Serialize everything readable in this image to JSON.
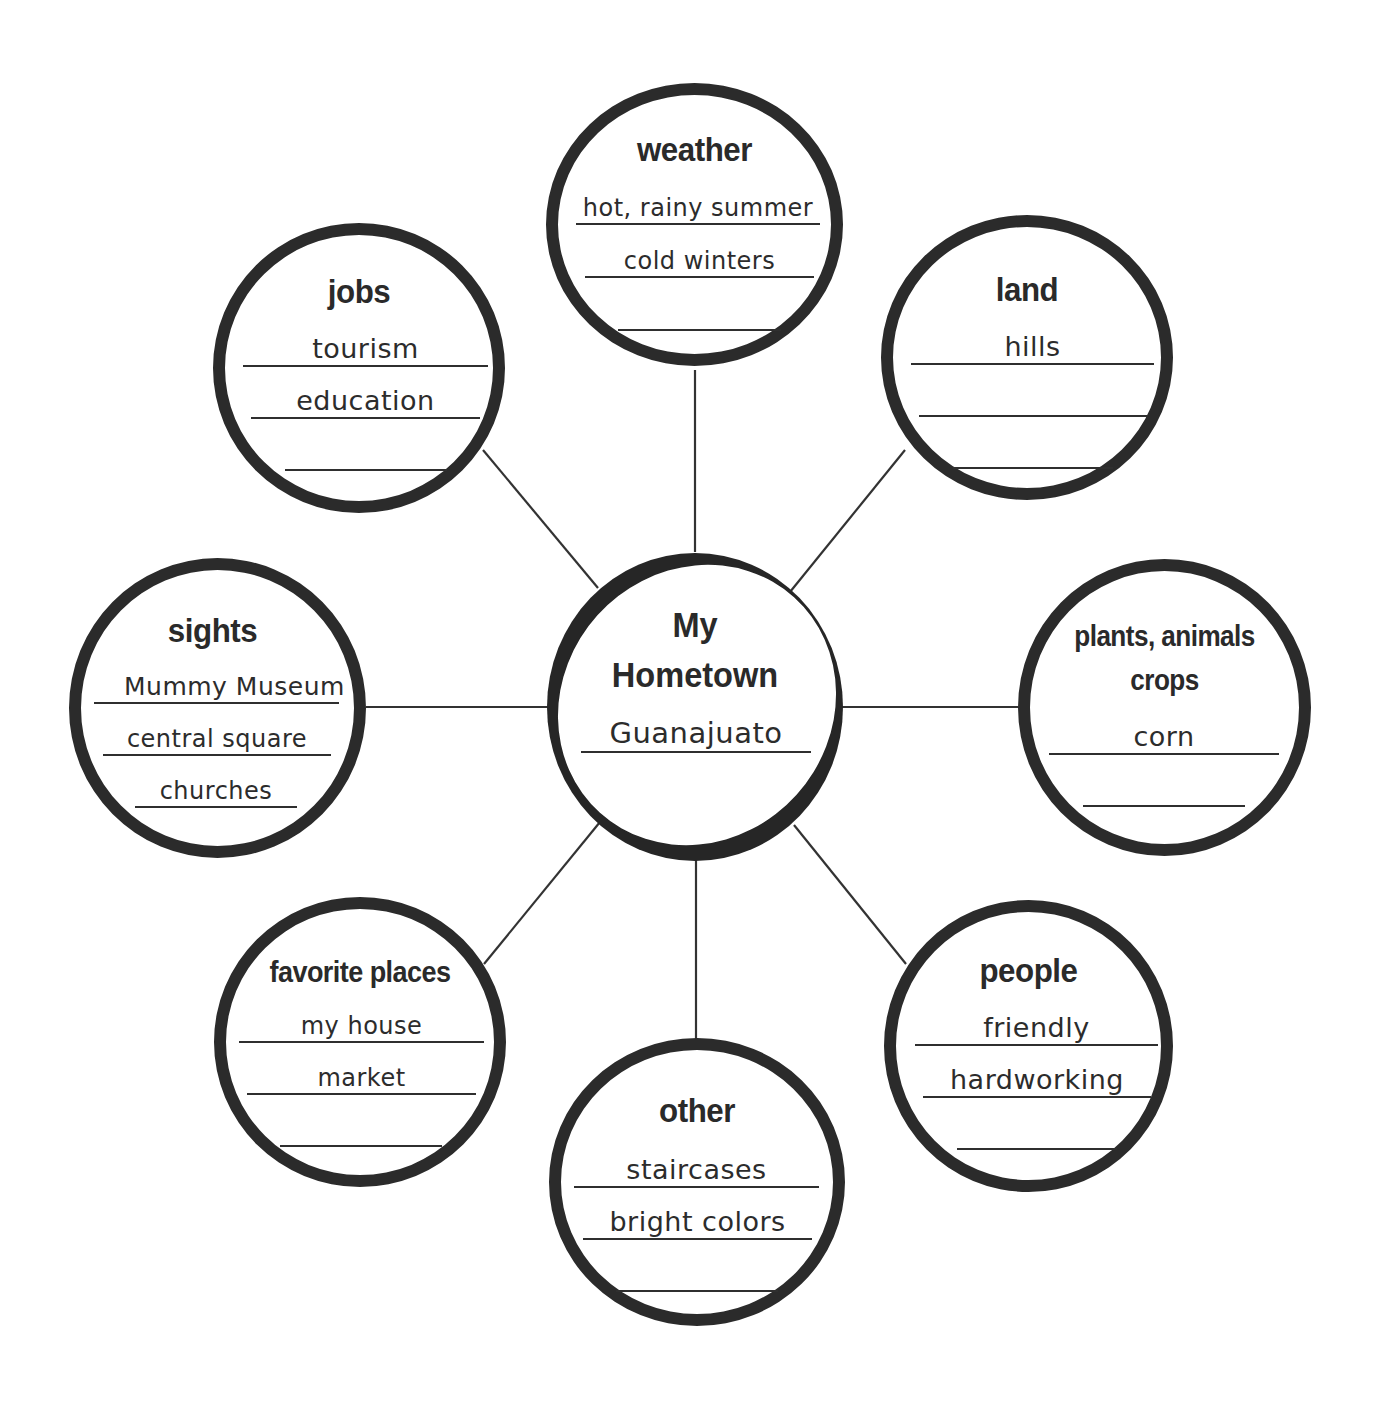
{
  "diagram": {
    "type": "bubble-map",
    "colors": {
      "stroke": "#2b2b2b",
      "background": "#ffffff",
      "text": "#2a2a2a"
    },
    "center": {
      "title_line1": "My",
      "title_line2": "Hometown",
      "answer": "Guanajuato"
    },
    "bubbles": {
      "weather": {
        "title": "weather",
        "lines": [
          "hot, rainy summer",
          "cold winters",
          ""
        ]
      },
      "jobs": {
        "title": "jobs",
        "lines": [
          "tourism",
          "education",
          ""
        ]
      },
      "land": {
        "title": "land",
        "lines": [
          "hills",
          "",
          ""
        ]
      },
      "sights": {
        "title": "sights",
        "lines": [
          "Mummy Museum",
          "central square",
          "churches"
        ]
      },
      "plants": {
        "title_line1": "plants, animals",
        "title_line2": "crops",
        "lines": [
          "corn",
          ""
        ]
      },
      "favorite": {
        "title": "favorite places",
        "lines": [
          "my house",
          "market",
          ""
        ]
      },
      "other": {
        "title": "other",
        "lines": [
          "staircases",
          "bright colors",
          ""
        ]
      },
      "people": {
        "title": "people",
        "lines": [
          "friendly",
          "hardworking",
          ""
        ]
      }
    }
  }
}
